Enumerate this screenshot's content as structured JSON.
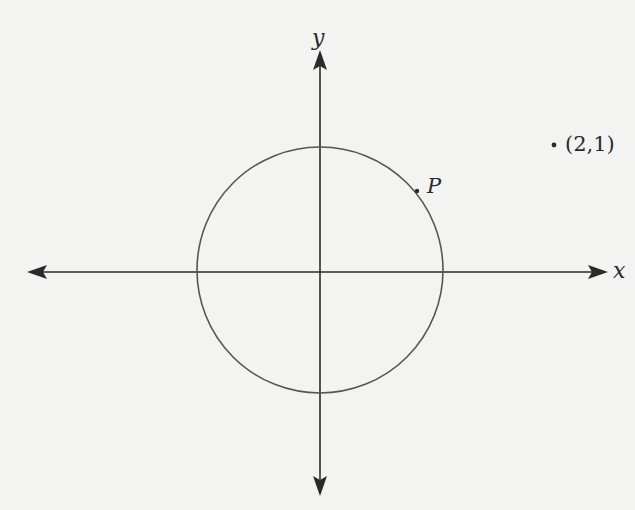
{
  "diagram": {
    "type": "unit-circle-coordinate-plane",
    "axes": {
      "x_label": "x",
      "y_label": "y"
    },
    "circle": {
      "center": [
        0,
        0
      ],
      "radius": 1
    },
    "point_on_circle": {
      "label": "P"
    },
    "external_point": {
      "label": "(2,1)"
    },
    "colors": {
      "background": "#f3f3f1",
      "ink": "#2a2a2a"
    }
  }
}
